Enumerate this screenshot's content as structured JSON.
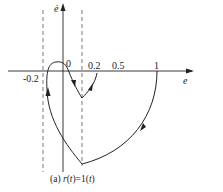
{
  "figure": {
    "caption_prefix": "(a) ",
    "caption_r": "r",
    "caption_mid": "(",
    "caption_t1": "t",
    "caption_eq": ")=1(",
    "caption_t2": "t",
    "caption_end": ")"
  },
  "axes": {
    "y_label": "ė",
    "x_label": "e",
    "ticks": [
      "-0.2",
      "0",
      "0.2",
      "0.5",
      "1"
    ]
  },
  "colors": {
    "stroke": "#222222",
    "dashed": "#555555"
  }
}
